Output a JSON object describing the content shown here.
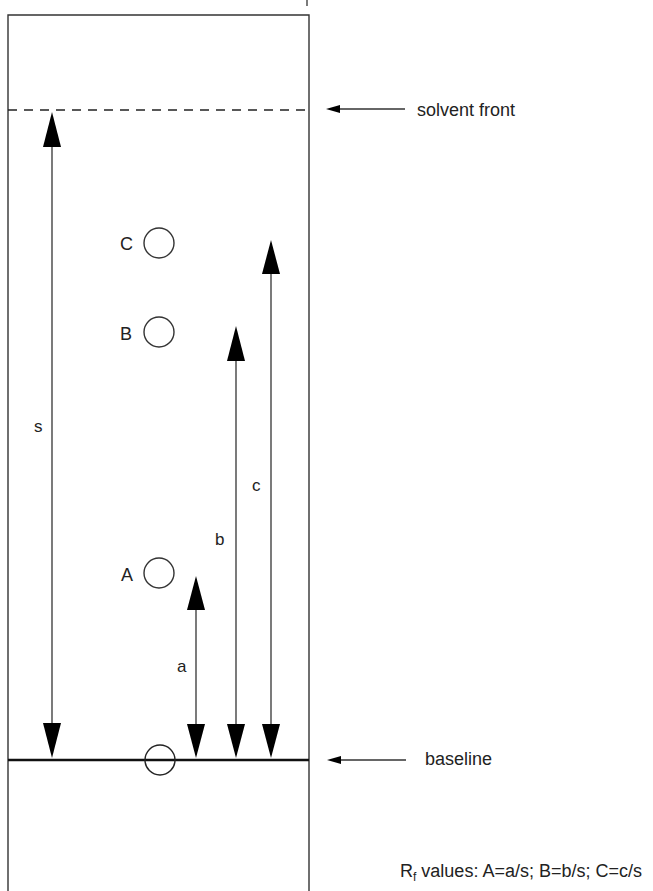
{
  "diagram": {
    "type": "thin-layer-chromatography",
    "colors": {
      "line": "#222222",
      "background": "#ffffff"
    },
    "plate": {
      "left": 8,
      "right": 309,
      "top": 15
    },
    "solvent_front": {
      "y": 110,
      "label": "solvent front"
    },
    "baseline": {
      "y": 760,
      "label": "baseline"
    },
    "origin_spot": {
      "cx": 160,
      "cy": 760,
      "r": 15
    },
    "spots": [
      {
        "id": "C",
        "label": "C",
        "cx": 159,
        "cy": 243
      },
      {
        "id": "B",
        "label": "B",
        "cx": 159,
        "cy": 332
      },
      {
        "id": "A",
        "label": "A",
        "cx": 159,
        "cy": 573
      }
    ],
    "distances": [
      {
        "id": "s",
        "label": "s",
        "x": 52,
        "top": 112,
        "bottom": 758,
        "label_x": 40,
        "label_y": 430
      },
      {
        "id": "a",
        "label": "a",
        "x": 196,
        "top": 577,
        "bottom": 758,
        "label_x": 182,
        "label_y": 670
      },
      {
        "id": "b",
        "label": "b",
        "x": 236,
        "top": 326,
        "bottom": 758,
        "label_x": 220,
        "label_y": 545
      },
      {
        "id": "c",
        "label": "c",
        "x": 271,
        "top": 240,
        "bottom": 758,
        "label_x": 257,
        "label_y": 490
      }
    ],
    "formula": {
      "prefix": "R",
      "subscript": "f",
      "text": " values: A=a/s; B=b/s; C=c/s"
    }
  }
}
